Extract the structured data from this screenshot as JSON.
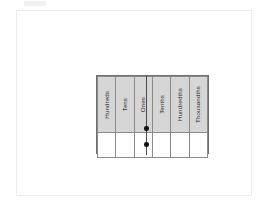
{
  "document": {
    "title": "Place Value Chart",
    "sheet_background": "#ffffff",
    "sheet_border_color": "#ececed"
  },
  "chart": {
    "header_fill": "#d6d6d6",
    "grid_line_color": "#8a8a8a",
    "outer_border_color": "#6e6e6e",
    "decimal_line_color": "#4a4a4a",
    "decimal_dot_color": "#141414",
    "columns": [
      {
        "label": "Hundreds",
        "value": ""
      },
      {
        "label": "Tens",
        "value": ""
      },
      {
        "label": "Ones",
        "value": ""
      },
      {
        "label": "Tenths",
        "value": ""
      },
      {
        "label": "Hundredths",
        "value": ""
      },
      {
        "label": "Thousandths",
        "value": ""
      }
    ],
    "decimal_point": {
      "between": "Ones and Tenths",
      "dot_count": 2
    }
  },
  "chart_data": {
    "type": "table",
    "categories": [
      "Hundreds",
      "Tens",
      "Ones",
      "Tenths",
      "Hundredths",
      "Thousandths"
    ],
    "values": [
      "",
      "",
      "",
      "",
      "",
      ""
    ],
    "xlabel": "",
    "ylabel": "",
    "annotations": [
      "decimal point between Ones and Tenths"
    ]
  }
}
